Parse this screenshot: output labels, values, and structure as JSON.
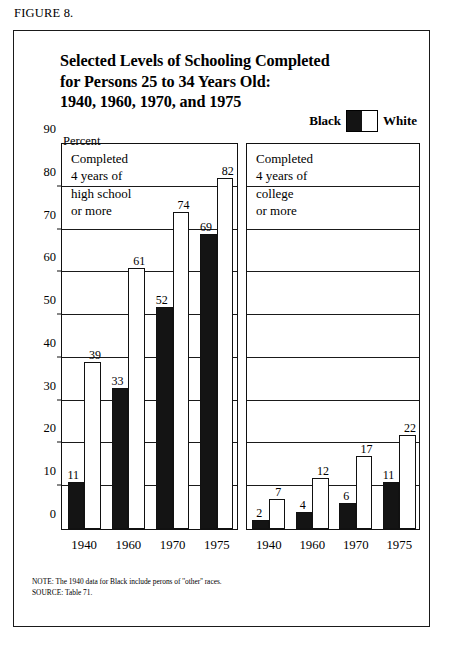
{
  "figure_caption": "FIGURE 8.",
  "title": {
    "line1": "Selected Levels of Schooling Completed",
    "line2": "for Persons 25 to 34 Years Old:",
    "line3": "1940, 1960, 1970, and 1975"
  },
  "legend": {
    "black_label": "Black",
    "white_label": "White"
  },
  "axis": {
    "percent_label": "Percent"
  },
  "annotations": {
    "left": {
      "l1": "Completed",
      "l2": "4 years of",
      "l3": "high school",
      "l4": "or more"
    },
    "right": {
      "l1": "Completed",
      "l2": "4 years of",
      "l3": "college",
      "l4": "or more"
    }
  },
  "footnotes": {
    "note": "NOTE: The 1940 data for Black include perons of ''other'' races.",
    "source": "SOURCE: Table 71."
  },
  "colors": {
    "black_series": "#141414",
    "white_series": "#ffffff",
    "ink": "#111111"
  },
  "chart_data": [
    {
      "id": "high-school",
      "type": "bar",
      "title": "Completed 4 years of high school or more",
      "xlabel": "",
      "ylabel": "Percent",
      "ylim": [
        0,
        90
      ],
      "yticks": [
        0,
        10,
        20,
        30,
        40,
        50,
        60,
        70,
        80,
        90
      ],
      "grid": true,
      "legend_position": "top-right",
      "categories": [
        "1940",
        "1960",
        "1970",
        "1975"
      ],
      "series": [
        {
          "name": "Black",
          "values": [
            11,
            33,
            52,
            69
          ]
        },
        {
          "name": "White",
          "values": [
            39,
            61,
            74,
            82
          ]
        }
      ]
    },
    {
      "id": "college",
      "type": "bar",
      "title": "Completed 4 years of college or more",
      "xlabel": "",
      "ylabel": "Percent",
      "ylim": [
        0,
        90
      ],
      "yticks": [
        0,
        10,
        20,
        30,
        40,
        50,
        60,
        70,
        80,
        90
      ],
      "grid": true,
      "legend_position": "top-right",
      "categories": [
        "1940",
        "1960",
        "1970",
        "1975"
      ],
      "series": [
        {
          "name": "Black",
          "values": [
            2,
            4,
            6,
            11
          ]
        },
        {
          "name": "White",
          "values": [
            7,
            12,
            17,
            22
          ]
        }
      ]
    }
  ]
}
